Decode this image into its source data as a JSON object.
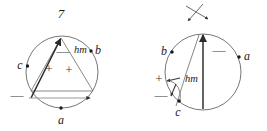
{
  "figure": {
    "title_number": "7",
    "background_color": "#ffffff",
    "stroke_color": "#555555",
    "text_color": "#1a1a1a",
    "sign_color": "#3a3a3a"
  },
  "left_diagram": {
    "name": "inscribed-triangle-circle",
    "top_number_label": "7",
    "point_labels": {
      "a": "a",
      "b": "b",
      "c": "c"
    },
    "hm_label": "hm",
    "signs": {
      "minus_near_hm": "—",
      "plus_left": "+",
      "plus_right": "+",
      "minus_bottom": "—"
    }
  },
  "right_diagram": {
    "name": "circle-with-vertical-axis",
    "point_labels": {
      "a": "a",
      "b": "b",
      "c": "c"
    },
    "hm_label": "hm",
    "signs": {
      "minus_upper_right": "—",
      "plus_left": "+",
      "minus_lower_left": "—"
    },
    "cross_marker": "x-crossing-arrows"
  }
}
